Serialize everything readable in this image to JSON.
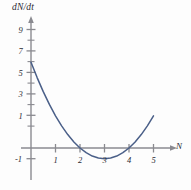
{
  "chart_data": {
    "type": "line",
    "title": "",
    "subtitle": "",
    "xlabel": "N",
    "ylabel": "dN/dt",
    "grid": false,
    "legend": null,
    "xlim": [
      -0.55,
      5.7
    ],
    "ylim": [
      -1.75,
      10.0
    ],
    "x_ticks_major": [
      1,
      2,
      3,
      4,
      5
    ],
    "x_tick_labels": [
      "1",
      "2",
      "3",
      "4",
      "5"
    ],
    "y_ticks_major": [
      -1,
      1,
      3,
      5,
      7,
      9
    ],
    "y_tick_labels": [
      "-1",
      "1",
      "3",
      "5",
      "7",
      "9"
    ],
    "y_ticks_minor": [
      0,
      2,
      4,
      6,
      8
    ],
    "curve_color": "#4a5f88",
    "axis_color": "#8a8a90",
    "text_color": "#2b2b33",
    "series": [
      {
        "name": "dN/dt = (N-2)(N-4)",
        "equation": "(N-2)(N-4)",
        "roots": [
          2,
          4
        ],
        "vertex": [
          3,
          -1
        ],
        "x": [
          0.0,
          0.25,
          0.5,
          0.75,
          1.0,
          1.25,
          1.5,
          1.75,
          2.0,
          2.25,
          2.5,
          2.75,
          3.0,
          3.25,
          3.5,
          3.75,
          4.0,
          4.25,
          4.5,
          4.75,
          5.0
        ],
        "values": [
          8.0,
          6.5625,
          5.25,
          4.0625,
          3.0,
          2.0625,
          1.25,
          0.5625,
          0.0,
          -0.4375,
          -0.75,
          -0.9375,
          -1.0,
          -0.9375,
          -0.75,
          -0.4375,
          0.0,
          0.5625,
          1.25,
          2.0625,
          3.0
        ]
      }
    ],
    "annotations": []
  },
  "axes": {
    "y_axis_label": "dN/dt",
    "x_axis_label": "N"
  }
}
